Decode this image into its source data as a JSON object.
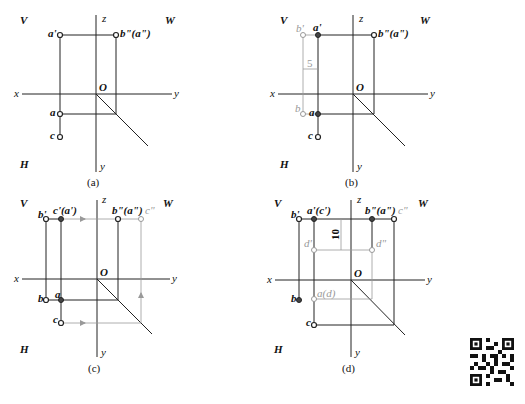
{
  "panels": [
    {
      "id": "a",
      "caption": "(a)",
      "quadrant_labels": {
        "V": "V",
        "W": "W",
        "H": "H"
      },
      "axis_labels": {
        "x": "x",
        "y_right": "y",
        "y_down": "y",
        "z": "z",
        "origin": "O"
      },
      "points": {
        "a_prime": "a'",
        "b2_a2": "b\"(a\")",
        "a": "a",
        "c": "c"
      }
    },
    {
      "id": "b",
      "caption": "(b)",
      "quadrant_labels": {
        "V": "V",
        "W": "W",
        "H": "H"
      },
      "axis_labels": {
        "x": "x",
        "y_right": "y",
        "y_down": "y",
        "z": "z",
        "origin": "O"
      },
      "points": {
        "b_prime": "b'",
        "a_prime": "a'",
        "b2_a2": "b\"(a\")",
        "b": "b",
        "a": "a",
        "c": "c"
      },
      "dimension": "5"
    },
    {
      "id": "c",
      "caption": "(c)",
      "quadrant_labels": {
        "V": "V",
        "W": "W",
        "H": "H"
      },
      "axis_labels": {
        "x": "x",
        "y_right": "y",
        "y_down": "y",
        "z": "z",
        "origin": "O"
      },
      "points": {
        "b_prime": "b'",
        "c_a_prime": "c'(a')",
        "b2_a2": "b\"(a\")",
        "c2": "c\"",
        "b": "b",
        "a": "a",
        "c": "c"
      }
    },
    {
      "id": "d",
      "caption": "(d)",
      "quadrant_labels": {
        "V": "V",
        "W": "W",
        "H": "H"
      },
      "axis_labels": {
        "x": "x",
        "y_right": "y",
        "y_down": "y",
        "z": "z",
        "origin": "O"
      },
      "points": {
        "b_prime": "b'",
        "a_c_prime": "a'(c')",
        "b2_a2": "b\"(a\")",
        "c2": "c\"",
        "d_prime": "d'",
        "d2": "d\"",
        "b": "b",
        "a_d": "a(d)",
        "c": "c"
      },
      "dimension": "10"
    }
  ]
}
